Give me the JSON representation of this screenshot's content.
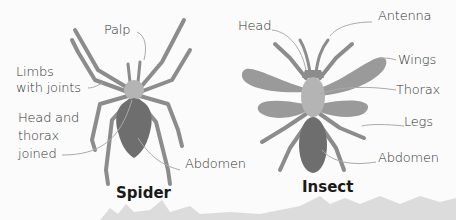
{
  "diagram": {
    "spider": {
      "title": "Spider",
      "labels": {
        "palp": "Palp",
        "limbs_line1": "Limbs",
        "limbs_line2": "with joints",
        "head_line1": "Head and",
        "head_line2": "thorax",
        "head_line3": "joined",
        "abdomen": "Abdomen"
      }
    },
    "insect": {
      "title": "Insect",
      "labels": {
        "head": "Head",
        "antenna": "Antenna",
        "wings": "Wings",
        "thorax": "Thorax",
        "legs": "Legs",
        "abdomen": "Abdomen"
      }
    },
    "colors": {
      "limb": "#8c8c8c",
      "cephalothorax": "#b4b4b4",
      "abdomen": "#6e6e6e",
      "wing": "#9a9a9a",
      "leader_line": "#aaaaaa",
      "ground": "#d8d8d8"
    }
  }
}
